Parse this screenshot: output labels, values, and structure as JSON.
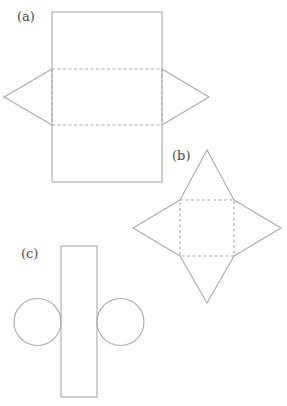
{
  "figures": {
    "a": {
      "label": "(a)",
      "description": "Net of a triangular prism: three stacked rectangles with triangular end faces on left and right",
      "colors": {
        "stroke": "#a9a9a9",
        "label": "#4a4a4a"
      }
    },
    "b": {
      "label": "(b)",
      "description": "Net of a square-based pyramid: dashed square with four triangles",
      "colors": {
        "stroke": "#a9a9a9",
        "label": "#4a4a4a"
      }
    },
    "c": {
      "label": "(c)",
      "description": "Net of a cylinder: tall rectangle with a circle on each side",
      "colors": {
        "stroke": "#a9a9a9",
        "label": "#4a4a4a"
      }
    }
  }
}
